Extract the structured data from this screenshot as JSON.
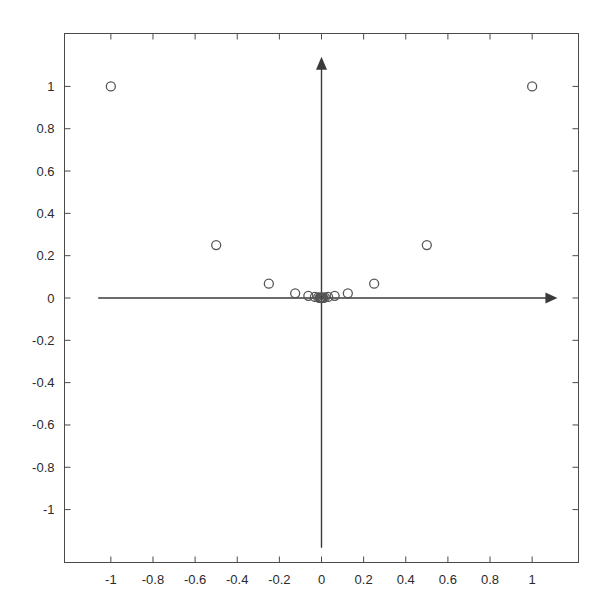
{
  "chart_data": {
    "type": "scatter",
    "title": "",
    "xlabel": "",
    "ylabel": "",
    "xlim": [
      -1.22,
      1.22
    ],
    "ylim": [
      -1.25,
      1.25
    ],
    "grid": false,
    "legend": null,
    "marker": {
      "shape": "circle",
      "filled": false,
      "edge_color": "#555555",
      "size_px": 9
    },
    "xticks": [
      -1,
      -0.8,
      -0.6,
      -0.4,
      -0.2,
      0,
      0.2,
      0.4,
      0.6,
      0.8,
      1
    ],
    "xtick_labels": [
      "-1",
      "-0.8",
      "-0.6",
      "-0.4",
      "-0.2",
      "0",
      "0.2",
      "0.4",
      "0.6",
      "0.8",
      "1"
    ],
    "yticks": [
      1,
      0.8,
      0.6,
      0.4,
      0.2,
      0,
      -0.2,
      -0.4,
      -0.6,
      -0.8,
      -1
    ],
    "ytick_labels": [
      "1",
      "0.8",
      "0.6",
      "0.4",
      "0.2",
      "0",
      "-0.2",
      "-0.4",
      "-0.6",
      "-0.8",
      "-1"
    ],
    "points": [
      {
        "x": -1.0,
        "y": 1.0
      },
      {
        "x": 1.0,
        "y": 1.0
      },
      {
        "x": -0.5,
        "y": 0.25
      },
      {
        "x": 0.5,
        "y": 0.25
      },
      {
        "x": -0.25,
        "y": 0.0675
      },
      {
        "x": 0.25,
        "y": 0.0675
      },
      {
        "x": -0.125,
        "y": 0.022
      },
      {
        "x": 0.125,
        "y": 0.022
      },
      {
        "x": -0.0625,
        "y": 0.0105
      },
      {
        "x": 0.0625,
        "y": 0.0105
      },
      {
        "x": -0.0312,
        "y": 0.005
      },
      {
        "x": 0.0312,
        "y": 0.005
      },
      {
        "x": -0.0156,
        "y": 0.0025
      },
      {
        "x": 0.0156,
        "y": 0.0025
      },
      {
        "x": -0.0078,
        "y": 0.0012
      },
      {
        "x": 0.0078,
        "y": 0.0012
      },
      {
        "x": -0.0039,
        "y": 0.0006
      },
      {
        "x": 0.0039,
        "y": 0.0006
      },
      {
        "x": -0.002,
        "y": 0.0003
      },
      {
        "x": 0.002,
        "y": 0.0003
      },
      {
        "x": -0.001,
        "y": 0.0002
      },
      {
        "x": 0.001,
        "y": 0.0002
      },
      {
        "x": 0.0,
        "y": 0.0
      }
    ],
    "axes_arrows": {
      "x_axis": {
        "from": [
          -1.06,
          0
        ],
        "to": [
          1.12,
          0
        ],
        "arrow": "right"
      },
      "y_axis": {
        "from": [
          0,
          -1.18
        ],
        "to": [
          0,
          1.14
        ],
        "arrow": "up"
      }
    }
  },
  "colors": {
    "frame": "#4a4a4a",
    "axis_line": "#3a3a3a",
    "marker_edge": "#555555",
    "tick_label": "#2b2b2b",
    "background": "#ffffff"
  }
}
